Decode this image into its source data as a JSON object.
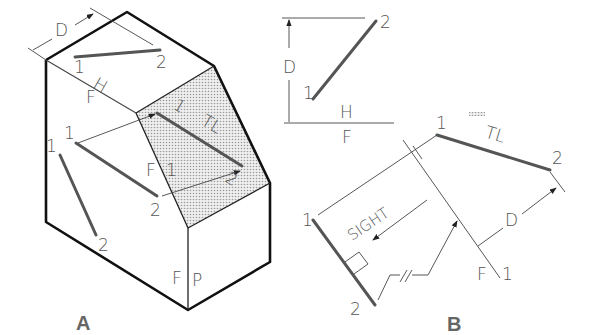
{
  "figure": {
    "panel_a": {
      "caption": "A",
      "labels": {
        "dim_d": "D",
        "top_point_1": "1",
        "top_point_2": "2",
        "fold_h": "H",
        "fold_f": "F",
        "front_point_1": "1",
        "front_point_2": "2",
        "side_point_1": "1",
        "side_point_2": "2",
        "aux_point_1": "1",
        "aux_point_2": "2",
        "tl": "TL",
        "aux_fold_f": "F",
        "aux_fold_1": "1",
        "fold_fp_f": "F",
        "fold_fp_p": "P"
      }
    },
    "panel_b": {
      "caption": "B",
      "labels": {
        "dim_d_top": "D",
        "top_point_1": "1",
        "top_point_2": "2",
        "fold_h": "H",
        "fold_f": "F",
        "front_point_1": "1",
        "front_point_2": "2",
        "tl": "TL",
        "dim_d_aux": "D",
        "aux_fold_f": "F",
        "aux_fold_1": "1",
        "point_view_1": "1",
        "point_view_2": "2",
        "sight": "SIGHT"
      }
    },
    "colors": {
      "edge": "#111111",
      "line": "#555555",
      "shade": "#d8d8d8"
    }
  }
}
